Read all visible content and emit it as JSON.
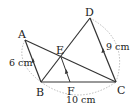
{
  "figure": {
    "points": {
      "A": {
        "label": "A",
        "x": 25,
        "y": 40
      },
      "B": {
        "label": "B",
        "x": 41,
        "y": 82
      },
      "C": {
        "label": "C",
        "x": 116,
        "y": 82
      },
      "D": {
        "label": "D",
        "x": 90,
        "y": 18
      },
      "E": {
        "label": "E",
        "x": 61,
        "y": 57
      },
      "F": {
        "label": "F",
        "x": 70,
        "y": 82
      }
    },
    "measurements": {
      "AB": "6 cm",
      "DC": "9 cm",
      "BC": "10 cm"
    },
    "segments": [
      "AB",
      "AC",
      "BD",
      "DC",
      "BC",
      "EF"
    ],
    "parallel_marks": [
      "AB",
      "EF",
      "DC"
    ],
    "colors": {
      "line": "#333333",
      "dashed_arc": "#aaaaaa",
      "text": "#222222"
    }
  }
}
